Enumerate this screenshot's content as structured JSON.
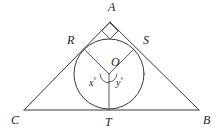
{
  "figure": {
    "type": "geometry-diagram",
    "background_color": "#ffffff",
    "stroke_color": "#3a3a3a",
    "label_color": "#1d1d1d",
    "vertices": {
      "A": {
        "label": "A",
        "x": 112,
        "y": 7
      },
      "B": {
        "label": "B",
        "x": 206,
        "y": 120
      },
      "C": {
        "label": "C",
        "x": 14,
        "y": 120
      }
    },
    "tangent_points": {
      "R": {
        "label": "R",
        "x": 71,
        "y": 41
      },
      "S": {
        "label": "S",
        "x": 146,
        "y": 41
      },
      "T": {
        "label": "T",
        "x": 109,
        "y": 123
      }
    },
    "center": {
      "label": "O",
      "x": 115,
      "y": 64
    },
    "angles": [
      {
        "label": "x",
        "degree_symbol": "°",
        "x": 92,
        "y": 81,
        "position": "left-of-OT"
      },
      {
        "label": "y",
        "degree_symbol": "°",
        "x": 119,
        "y": 81,
        "position": "right-of-OT"
      }
    ],
    "markers": {
      "right_angle_at_A": {
        "name": "right-angle-marker",
        "shown": true
      },
      "angle_arc_x": {
        "name": "angle-arc-x",
        "shown": true
      },
      "angle_arc_y": {
        "name": "angle-arc-y",
        "shown": true
      }
    },
    "segments": [
      {
        "name": "side-AC",
        "from": "A",
        "to": "C"
      },
      {
        "name": "side-AB",
        "from": "A",
        "to": "B"
      },
      {
        "name": "side-CB",
        "from": "C",
        "to": "B"
      },
      {
        "name": "radius-OR",
        "from": "O",
        "to": "R"
      },
      {
        "name": "radius-OS",
        "from": "O",
        "to": "S"
      },
      {
        "name": "radius-OT",
        "from": "O",
        "to": "T"
      }
    ],
    "circle": {
      "name": "inscribed-circle",
      "cx": 109,
      "cy": 74,
      "r": 35
    }
  }
}
